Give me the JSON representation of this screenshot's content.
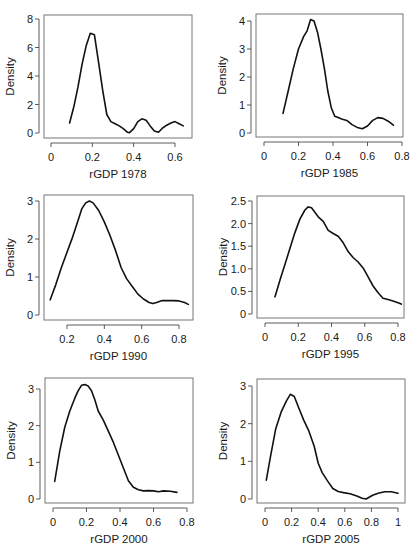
{
  "figure": {
    "layout": "3 rows x 2 columns",
    "line_color": "#111111",
    "frame_color": "#777777"
  },
  "chart_data": [
    {
      "type": "line",
      "title": "",
      "xlabel": "rGDP 1978",
      "ylabel": "Density",
      "xlim": [
        0,
        0.66
      ],
      "ylim": [
        0,
        8
      ],
      "xticks": [
        0,
        0.2,
        0.4,
        0.6
      ],
      "xtick_labels": [
        "0",
        "0.2",
        "0.4",
        "0.6"
      ],
      "yticks": [
        0,
        2,
        4,
        6,
        8
      ],
      "ytick_labels": [
        "0",
        "2",
        "4",
        "6",
        "8"
      ],
      "grid": false,
      "x": [
        0.09,
        0.11,
        0.13,
        0.15,
        0.17,
        0.19,
        0.21,
        0.23,
        0.25,
        0.27,
        0.29,
        0.31,
        0.33,
        0.35,
        0.37,
        0.38,
        0.4,
        0.42,
        0.44,
        0.46,
        0.48,
        0.5,
        0.52,
        0.54,
        0.56,
        0.58,
        0.6,
        0.62,
        0.64
      ],
      "y": [
        0.7,
        1.8,
        3.2,
        4.8,
        6.1,
        7.0,
        6.9,
        5.0,
        3.0,
        1.3,
        0.8,
        0.65,
        0.5,
        0.3,
        0.05,
        0.02,
        0.3,
        0.8,
        1.0,
        0.9,
        0.5,
        0.15,
        0.05,
        0.35,
        0.55,
        0.7,
        0.8,
        0.65,
        0.5
      ]
    },
    {
      "type": "line",
      "title": "",
      "xlabel": "rGDP 1985",
      "ylabel": "Density",
      "xlim": [
        0,
        0.8
      ],
      "ylim": [
        0,
        4
      ],
      "xticks": [
        0,
        0.2,
        0.4,
        0.6,
        0.8
      ],
      "xtick_labels": [
        "0",
        "0.2",
        "0.4",
        "0.6",
        "0.8"
      ],
      "yticks": [
        0,
        1,
        2,
        3,
        4
      ],
      "ytick_labels": [
        "0",
        "1",
        "2",
        "3",
        "4"
      ],
      "grid": false,
      "x": [
        0.11,
        0.14,
        0.17,
        0.2,
        0.23,
        0.25,
        0.27,
        0.29,
        0.31,
        0.33,
        0.35,
        0.37,
        0.39,
        0.41,
        0.43,
        0.45,
        0.48,
        0.51,
        0.54,
        0.57,
        0.6,
        0.63,
        0.66,
        0.69,
        0.72,
        0.75
      ],
      "y": [
        0.7,
        1.5,
        2.3,
        3.0,
        3.45,
        3.65,
        4.05,
        4.0,
        3.6,
        3.0,
        2.3,
        1.5,
        0.9,
        0.6,
        0.55,
        0.5,
        0.45,
        0.3,
        0.2,
        0.15,
        0.25,
        0.45,
        0.55,
        0.52,
        0.42,
        0.28
      ]
    },
    {
      "type": "line",
      "title": "",
      "xlabel": "rGDP 1990",
      "ylabel": "Density",
      "xlim": [
        0.1,
        0.86
      ],
      "ylim": [
        0,
        3
      ],
      "xticks": [
        0.2,
        0.4,
        0.6,
        0.8
      ],
      "xtick_labels": [
        "0.2",
        "0.4",
        "0.6",
        "0.8"
      ],
      "yticks": [
        0,
        1,
        2,
        3
      ],
      "ytick_labels": [
        "0",
        "1",
        "2",
        "3"
      ],
      "grid": false,
      "x": [
        0.11,
        0.14,
        0.17,
        0.2,
        0.23,
        0.26,
        0.28,
        0.3,
        0.32,
        0.34,
        0.37,
        0.4,
        0.43,
        0.46,
        0.49,
        0.52,
        0.55,
        0.58,
        0.61,
        0.64,
        0.66,
        0.68,
        0.71,
        0.74,
        0.77,
        0.8,
        0.83,
        0.85
      ],
      "y": [
        0.4,
        0.8,
        1.25,
        1.65,
        2.05,
        2.5,
        2.8,
        2.95,
        3.0,
        2.95,
        2.75,
        2.45,
        2.1,
        1.7,
        1.25,
        0.95,
        0.75,
        0.55,
        0.42,
        0.33,
        0.3,
        0.33,
        0.38,
        0.38,
        0.38,
        0.37,
        0.33,
        0.28
      ]
    },
    {
      "type": "line",
      "title": "",
      "xlabel": "rGDP 1995",
      "ylabel": "Density",
      "xlim": [
        0,
        0.84
      ],
      "ylim": [
        0,
        2.5
      ],
      "xticks": [
        0,
        0.2,
        0.4,
        0.6,
        0.8
      ],
      "xtick_labels": [
        "0",
        "0.2",
        "0.4",
        "0.6",
        "0.8"
      ],
      "yticks": [
        0,
        0.5,
        1.0,
        1.5,
        2.0,
        2.5
      ],
      "ytick_labels": [
        "0",
        "0.5",
        "1.0",
        "1.5",
        "2.0",
        "2.5"
      ],
      "grid": false,
      "x": [
        0.06,
        0.09,
        0.12,
        0.15,
        0.18,
        0.21,
        0.24,
        0.26,
        0.28,
        0.3,
        0.32,
        0.35,
        0.38,
        0.41,
        0.44,
        0.47,
        0.5,
        0.53,
        0.56,
        0.59,
        0.62,
        0.65,
        0.68,
        0.71,
        0.74,
        0.77,
        0.8,
        0.82
      ],
      "y": [
        0.38,
        0.75,
        1.1,
        1.45,
        1.8,
        2.1,
        2.3,
        2.37,
        2.35,
        2.25,
        2.15,
        2.05,
        1.85,
        1.78,
        1.72,
        1.58,
        1.38,
        1.25,
        1.15,
        1.02,
        0.82,
        0.62,
        0.47,
        0.35,
        0.32,
        0.29,
        0.25,
        0.22
      ]
    },
    {
      "type": "line",
      "title": "",
      "xlabel": "rGDP 2000",
      "ylabel": "Density",
      "xlim": [
        0,
        0.8
      ],
      "ylim": [
        0,
        3
      ],
      "xticks": [
        0,
        0.2,
        0.4,
        0.6,
        0.8
      ],
      "xtick_labels": [
        "0",
        "0.2",
        "0.4",
        "0.6",
        "0.8"
      ],
      "yticks": [
        0,
        1,
        2,
        3
      ],
      "ytick_labels": [
        "0",
        "1",
        "2",
        "3"
      ],
      "grid": false,
      "x": [
        0.01,
        0.04,
        0.07,
        0.1,
        0.13,
        0.15,
        0.17,
        0.19,
        0.21,
        0.23,
        0.25,
        0.27,
        0.3,
        0.33,
        0.36,
        0.39,
        0.42,
        0.45,
        0.48,
        0.51,
        0.54,
        0.57,
        0.6,
        0.63,
        0.66,
        0.7,
        0.74
      ],
      "y": [
        0.48,
        1.3,
        1.95,
        2.4,
        2.75,
        2.95,
        3.1,
        3.12,
        3.08,
        2.95,
        2.7,
        2.4,
        2.15,
        1.85,
        1.55,
        1.2,
        0.85,
        0.5,
        0.32,
        0.25,
        0.22,
        0.23,
        0.22,
        0.2,
        0.22,
        0.21,
        0.18
      ]
    },
    {
      "type": "line",
      "title": "",
      "xlabel": "rGDP 2005",
      "ylabel": "Density",
      "xlim": [
        0,
        1.02
      ],
      "ylim": [
        0,
        3
      ],
      "xticks": [
        0,
        0.2,
        0.4,
        0.6,
        0.8,
        1
      ],
      "xtick_labels": [
        "0",
        "0.2",
        "0.4",
        "0.6",
        "0.8",
        "1"
      ],
      "yticks": [
        0,
        1,
        2,
        3
      ],
      "ytick_labels": [
        "0",
        "1",
        "2",
        "3"
      ],
      "grid": false,
      "x": [
        0.01,
        0.04,
        0.08,
        0.12,
        0.16,
        0.19,
        0.22,
        0.25,
        0.29,
        0.33,
        0.37,
        0.4,
        0.43,
        0.47,
        0.51,
        0.55,
        0.59,
        0.64,
        0.69,
        0.73,
        0.76,
        0.78,
        0.81,
        0.85,
        0.9,
        0.95,
        1.0
      ],
      "y": [
        0.5,
        1.1,
        1.85,
        2.3,
        2.6,
        2.78,
        2.72,
        2.45,
        2.1,
        1.8,
        1.4,
        0.95,
        0.7,
        0.48,
        0.28,
        0.2,
        0.17,
        0.14,
        0.08,
        0.02,
        0.0,
        0.04,
        0.1,
        0.15,
        0.19,
        0.19,
        0.15
      ]
    }
  ]
}
